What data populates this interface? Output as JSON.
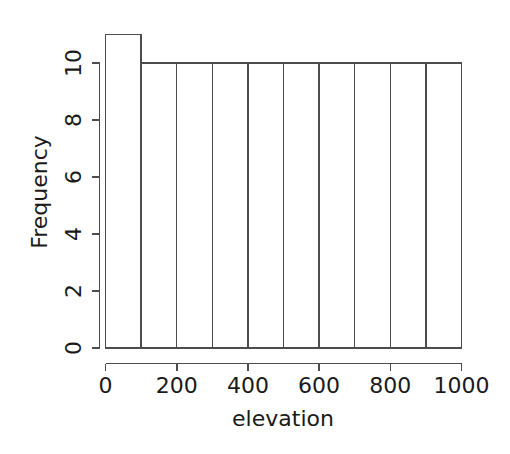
{
  "chart_data": {
    "type": "bar",
    "title": "",
    "subtitle": "",
    "xlabel": "elevation",
    "ylabel": "Frequency",
    "xlim": [
      0,
      1000
    ],
    "ylim": [
      0,
      11
    ],
    "grid": false,
    "legend": null,
    "legend_position": "none",
    "bin_width": 100,
    "categories": [
      "0-100",
      "100-200",
      "200-300",
      "300-400",
      "400-500",
      "500-600",
      "600-700",
      "700-800",
      "800-900",
      "900-1000"
    ],
    "bin_edges": [
      0,
      100,
      200,
      300,
      400,
      500,
      600,
      700,
      800,
      900,
      1000
    ],
    "values": [
      11,
      10,
      10,
      10,
      10,
      10,
      10,
      10,
      10,
      10
    ],
    "x_ticks": [
      0,
      200,
      400,
      600,
      800,
      1000
    ],
    "x_tick_labels": [
      "0",
      "200",
      "400",
      "600",
      "800",
      "1000"
    ],
    "y_ticks": [
      0,
      2,
      4,
      6,
      8,
      10
    ],
    "y_tick_labels": [
      "0",
      "2",
      "4",
      "6",
      "8",
      "10"
    ],
    "total_count": 101,
    "annotations": []
  },
  "style": {
    "background": "#ffffff",
    "line_color": "#4d4d4d",
    "text_color": "#1a1a1a",
    "bar_fill": "#ffffff"
  },
  "figure": {
    "title_fragment": "",
    "caption": ""
  }
}
